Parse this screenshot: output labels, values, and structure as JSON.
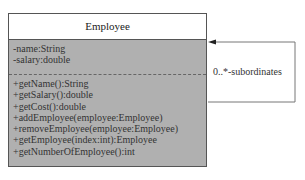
{
  "class": {
    "name": "Employee",
    "attributes": [
      "-name:String",
      "-salary:double"
    ],
    "operations": [
      "+getName():String",
      "+getSalary():double",
      "+getCost():double",
      "+addEmployee(employee:Employee)",
      "+removeEmployee(employee:Employee)",
      "+getEmployee(index:int):Employee",
      "+getNumberOfEmployee():int"
    ]
  },
  "association": {
    "label": "0..*-subordinates",
    "type": "self-aggregation"
  },
  "colors": {
    "body": "#b0b0b0",
    "header": "#ffffff",
    "line": "#555555"
  }
}
